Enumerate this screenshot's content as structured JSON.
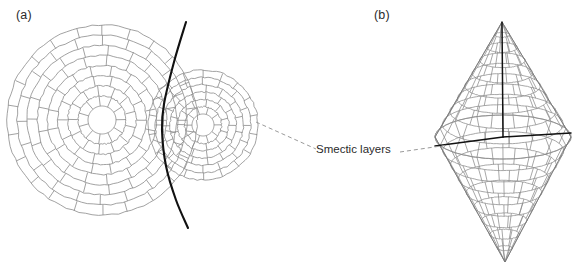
{
  "figure": {
    "background": "#ffffff",
    "width": 582,
    "height": 276
  },
  "panels": [
    {
      "id": "a",
      "label": "(a)",
      "type": "focal-conic-onion-texture-2d",
      "description": "Two concentric-ring smectic onion domains separated by a dark curved wall",
      "domains": [
        {
          "name": "large-onion",
          "cx": 102,
          "cy": 120,
          "inner_r": 14,
          "outer_r": 95,
          "rings": 8,
          "sectors": 22
        },
        {
          "name": "small-onion",
          "cx": 203,
          "cy": 125,
          "inner_r": 11,
          "outer_r": 55,
          "rings": 6,
          "sectors": 18
        }
      ],
      "wall": {
        "name": "domain-wall-curve",
        "color": "#111111",
        "width": 2.1,
        "points": [
          [
            186,
            22
          ],
          [
            174,
            62
          ],
          [
            164,
            104
          ],
          [
            162,
            130
          ],
          [
            166,
            166
          ],
          [
            176,
            200
          ],
          [
            188,
            228
          ]
        ]
      }
    },
    {
      "id": "b",
      "label": "(b)",
      "type": "double-cone-bipyramid-3d",
      "description": "Three dimensional bipyramid (double cone) of stacked smectic layers",
      "geometry": {
        "top_apex": [
          502,
          22
        ],
        "bottom_apex": [
          505,
          262
        ],
        "equator_center": [
          503,
          137
        ],
        "equator_rx": 68,
        "equator_ry": 22,
        "upper_layers": 9,
        "lower_layers": 9,
        "meridians": 16
      },
      "axes": {
        "vertical_axis": {
          "name": "vertical-axis-line",
          "color": "#111111"
        },
        "left_radius": {
          "name": "left-radius-line",
          "color": "#111111"
        },
        "right_radius": {
          "name": "right-radius-line",
          "color": "#111111"
        }
      }
    }
  ],
  "annotation": {
    "label": "Smectic layers",
    "leader_left": {
      "from": [
        256,
        122
      ],
      "to": [
        316,
        149
      ]
    },
    "leader_right": {
      "from": [
        400,
        152
      ],
      "to": [
        448,
        145
      ]
    },
    "style": "dashed"
  },
  "colors": {
    "layer_line": "#8a8a8a",
    "dark_line": "#111111",
    "dashed_line": "#9a9a9a",
    "text": "#2b2b2b",
    "background": "#ffffff"
  }
}
